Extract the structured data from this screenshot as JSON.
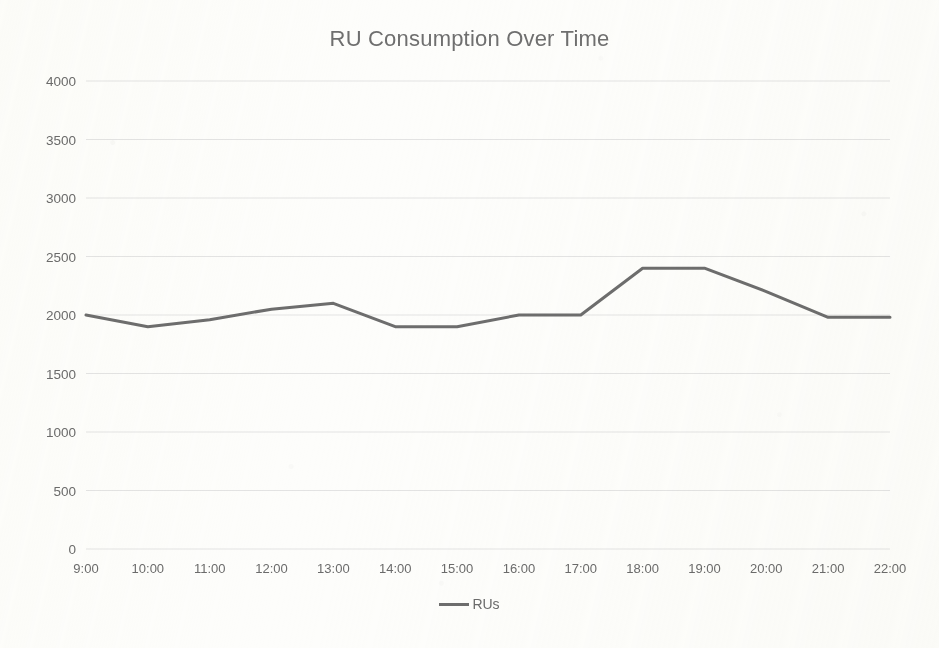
{
  "chart_data": {
    "type": "line",
    "title": "RU Consumption Over Time",
    "xlabel": "",
    "ylabel": "",
    "categories": [
      "9:00",
      "10:00",
      "11:00",
      "12:00",
      "13:00",
      "14:00",
      "15:00",
      "16:00",
      "17:00",
      "18:00",
      "19:00",
      "20:00",
      "21:00",
      "22:00"
    ],
    "series": [
      {
        "name": "RUs",
        "values": [
          2000,
          1900,
          1960,
          2050,
          2100,
          1900,
          1900,
          2000,
          2000,
          2400,
          2400,
          2200,
          1980,
          1980
        ],
        "color": "#6d6d6d"
      }
    ],
    "ylim": [
      0,
      4000
    ],
    "yticks": [
      0,
      500,
      1000,
      1500,
      2000,
      2500,
      3000,
      3500,
      4000
    ],
    "ytick_labels": [
      "0",
      "500",
      "1000",
      "1500",
      "2000",
      "2500",
      "3000",
      "3500",
      "4000"
    ],
    "grid": true,
    "grid_color": "#e3e3e3",
    "legend": {
      "visible": true,
      "position": "bottom",
      "entries": [
        {
          "label": "RUs",
          "marker": "line-marker",
          "color": "#6d6d6d"
        }
      ]
    },
    "background_color": "#fdfdfb",
    "text_color": "#6b6b6b"
  }
}
